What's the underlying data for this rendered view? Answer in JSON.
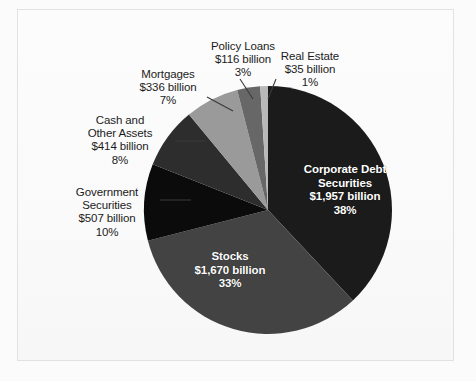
{
  "chart_data": {
    "type": "pie",
    "title": "",
    "subtitle": "",
    "xlabel": "",
    "ylabel": "",
    "legend_position": "labels-on-chart",
    "grid": false,
    "value_unit": "billion US dollars",
    "total_label": "",
    "categories": [
      "Corporate Debt Securities",
      "Stocks",
      "Government Securities",
      "Cash and Other Assets",
      "Mortgages",
      "Policy Loans",
      "Real Estate"
    ],
    "values": [
      1957,
      1670,
      507,
      414,
      336,
      116,
      35
    ],
    "percentages": [
      38,
      33,
      10,
      8,
      7,
      3,
      1
    ],
    "value_texts": [
      "$1,957 billion",
      "$1,670 billion",
      "$507 billion",
      "$414 billion",
      "$336 billion",
      "$116 billion",
      "$35 billion"
    ],
    "percent_texts": [
      "38%",
      "33%",
      "10%",
      "8%",
      "7%",
      "3%",
      "1%"
    ],
    "colors": [
      "#1b1b1b",
      "#434343",
      "#0b0b0b",
      "#2d2d2d",
      "#9a9a9a",
      "#676767",
      "#b9b9b9"
    ],
    "slices": [
      {
        "name": "Corporate Debt Securities",
        "label_line1": "Corporate Debt",
        "label_line2": "Securities",
        "value_text": "$1,957 billion",
        "percent_text": "38%",
        "value": 1957,
        "percent": 38,
        "color": "#1b1b1b",
        "label_placement": "inside"
      },
      {
        "name": "Stocks",
        "label_line1": "Stocks",
        "label_line2": "",
        "value_text": "$1,670 billion",
        "percent_text": "33%",
        "value": 1670,
        "percent": 33,
        "color": "#434343",
        "label_placement": "inside"
      },
      {
        "name": "Government Securities",
        "label_line1": "Government",
        "label_line2": "Securities",
        "value_text": "$507 billion",
        "percent_text": "10%",
        "value": 507,
        "percent": 10,
        "color": "#0b0b0b",
        "label_placement": "outside-left"
      },
      {
        "name": "Cash and Other Assets",
        "label_line1": "Cash and",
        "label_line2": "Other Assets",
        "value_text": "$414 billion",
        "percent_text": "8%",
        "value": 414,
        "percent": 8,
        "color": "#2d2d2d",
        "label_placement": "outside-left"
      },
      {
        "name": "Mortgages",
        "label_line1": "Mortgages",
        "label_line2": "",
        "value_text": "$336 billion",
        "percent_text": "7%",
        "value": 336,
        "percent": 7,
        "color": "#9a9a9a",
        "label_placement": "outside-upper-left"
      },
      {
        "name": "Policy Loans",
        "label_line1": "Policy Loans",
        "label_line2": "",
        "value_text": "$116 billion",
        "percent_text": "3%",
        "value": 116,
        "percent": 3,
        "color": "#676767",
        "label_placement": "outside-top"
      },
      {
        "name": "Real Estate",
        "label_line1": "Real Estate",
        "label_line2": "",
        "value_text": "$35 billion",
        "percent_text": "1%",
        "value": 35,
        "percent": 1,
        "color": "#b9b9b9",
        "label_placement": "outside-top-right"
      }
    ]
  },
  "figure": {
    "background_color": "#fbfbfb",
    "paper_color": "#fafafa",
    "border_color": "#e2e2e2",
    "label_text_color": "#1b1b1b",
    "inside_label_text_color": "#ffffff",
    "leader_line_color": "#3a3a3a",
    "ghost_text": "."
  }
}
